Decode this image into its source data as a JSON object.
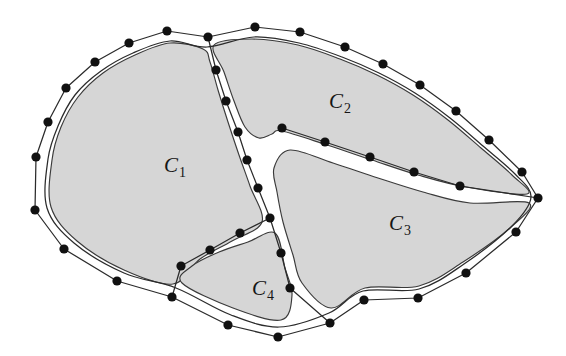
{
  "figure": {
    "background_color": "#ffffff",
    "fill_color": "#d6d6d6",
    "stroke_color": "#2b2b2b",
    "dot_color": "#111111",
    "width": 566,
    "height": 356
  },
  "labels": [
    {
      "name": "label-c1",
      "base": "C",
      "sub": "1",
      "x": 175,
      "y": 172
    },
    {
      "name": "label-c2",
      "base": "C",
      "sub": "2",
      "x": 340,
      "y": 108
    },
    {
      "name": "label-c3",
      "base": "C",
      "sub": "3",
      "x": 400,
      "y": 230
    },
    {
      "name": "label-c4",
      "base": "C",
      "sub": "4",
      "x": 263,
      "y": 295
    }
  ],
  "chart_data": {
    "type": "diagram",
    "hull_points": [
      [
        208,
        37
      ],
      [
        167,
        31
      ],
      [
        129,
        43
      ],
      [
        95,
        62
      ],
      [
        66,
        88
      ],
      [
        48,
        122
      ],
      [
        36,
        157
      ],
      [
        35,
        210
      ],
      [
        64,
        249
      ],
      [
        117,
        281
      ],
      [
        172,
        297
      ],
      [
        228,
        325
      ],
      [
        278,
        337
      ],
      [
        330,
        323
      ],
      [
        364,
        300
      ],
      [
        418,
        298
      ],
      [
        466,
        273
      ],
      [
        516,
        232
      ],
      [
        538,
        198
      ],
      [
        522,
        172
      ],
      [
        489,
        140
      ],
      [
        456,
        111
      ],
      [
        420,
        85
      ],
      [
        383,
        64
      ],
      [
        345,
        47
      ],
      [
        300,
        32
      ],
      [
        255,
        27
      ]
    ],
    "inner_outline": [
      [
        207,
        47
      ],
      [
        170,
        41
      ],
      [
        133,
        53
      ],
      [
        101,
        71
      ],
      [
        75,
        95
      ],
      [
        58,
        126
      ],
      [
        48,
        159
      ],
      [
        47,
        208
      ],
      [
        74,
        243
      ],
      [
        124,
        273
      ],
      [
        176,
        288
      ],
      [
        231,
        315
      ],
      [
        279,
        327
      ],
      [
        329,
        313
      ],
      [
        363,
        291
      ],
      [
        419,
        289
      ],
      [
        464,
        264
      ],
      [
        512,
        226
      ],
      [
        531,
        197
      ],
      [
        515,
        174
      ],
      [
        483,
        146
      ],
      [
        450,
        118
      ],
      [
        415,
        93
      ],
      [
        379,
        73
      ],
      [
        342,
        57
      ],
      [
        299,
        43
      ],
      [
        254,
        37
      ]
    ],
    "cut_c1_c2": {
      "name": "cut-c1-c2",
      "points": [
        [
          208,
          37
        ],
        [
          216,
          70
        ],
        [
          226,
          101
        ],
        [
          238,
          132
        ],
        [
          247,
          160
        ],
        [
          258,
          188
        ],
        [
          270,
          218
        ],
        [
          281,
          253
        ],
        [
          290,
          288
        ]
      ]
    },
    "cut_c1_c4": {
      "name": "cut-c1-c4",
      "points": [
        [
          270,
          218
        ],
        [
          240,
          233
        ],
        [
          210,
          250
        ],
        [
          181,
          266
        ],
        [
          172,
          297
        ]
      ]
    },
    "cut_c2_c3": {
      "name": "cut-c2-c3",
      "points": [
        [
          282,
          128
        ],
        [
          325,
          142
        ],
        [
          370,
          157
        ],
        [
          414,
          172
        ],
        [
          460,
          186
        ],
        [
          538,
          198
        ]
      ]
    },
    "cut_c3_c4": {
      "name": "cut-c3-c4",
      "points": [
        [
          290,
          288
        ],
        [
          330,
          323
        ]
      ]
    },
    "regions": [
      {
        "id": "C1",
        "label": "C1",
        "name": "region-c1",
        "outline": [
          [
            203,
            49
          ],
          [
            170,
            43
          ],
          [
            135,
            55
          ],
          [
            103,
            73
          ],
          [
            78,
            97
          ],
          [
            61,
            127
          ],
          [
            52,
            160
          ],
          [
            51,
            207
          ],
          [
            77,
            241
          ],
          [
            124,
            270
          ],
          [
            173,
            284
          ],
          [
            200,
            259
          ],
          [
            232,
            241
          ],
          [
            262,
            222
          ],
          [
            250,
            186
          ],
          [
            239,
            155
          ],
          [
            228,
            122
          ],
          [
            218,
            90
          ],
          [
            210,
            62
          ]
        ]
      },
      {
        "id": "C2",
        "label": "C2",
        "name": "region-c2",
        "outline": [
          [
            214,
            45
          ],
          [
            252,
            39
          ],
          [
            298,
            45
          ],
          [
            340,
            59
          ],
          [
            377,
            75
          ],
          [
            413,
            95
          ],
          [
            448,
            120
          ],
          [
            481,
            148
          ],
          [
            512,
            175
          ],
          [
            527,
            194
          ],
          [
            466,
            187
          ],
          [
            418,
            175
          ],
          [
            372,
            160
          ],
          [
            327,
            145
          ],
          [
            282,
            131
          ],
          [
            272,
            134
          ],
          [
            259,
            138
          ],
          [
            245,
            127
          ],
          [
            234,
            101
          ],
          [
            224,
            72
          ]
        ]
      },
      {
        "id": "C3",
        "label": "C3",
        "name": "region-c3",
        "outline": [
          [
            290,
            150
          ],
          [
            333,
            163
          ],
          [
            378,
            178
          ],
          [
            423,
            192
          ],
          [
            470,
            203
          ],
          [
            529,
            203
          ],
          [
            510,
            228
          ],
          [
            463,
            262
          ],
          [
            419,
            286
          ],
          [
            365,
            288
          ],
          [
            331,
            308
          ],
          [
            302,
            283
          ],
          [
            293,
            255
          ],
          [
            283,
            222
          ],
          [
            277,
            192
          ],
          [
            274,
            168
          ]
        ]
      },
      {
        "id": "C4",
        "label": "C4",
        "name": "region-c4",
        "outline": [
          [
            275,
            233
          ],
          [
            285,
            268
          ],
          [
            292,
            295
          ],
          [
            281,
            320
          ],
          [
            233,
            308
          ],
          [
            182,
            283
          ],
          [
            192,
            266
          ],
          [
            219,
            252
          ],
          [
            248,
            242
          ]
        ]
      }
    ]
  }
}
